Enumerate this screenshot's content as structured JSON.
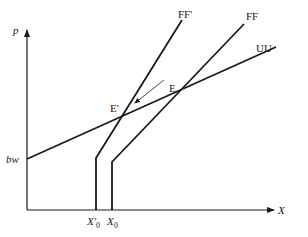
{
  "diagram": {
    "axes": {
      "y_label": "p",
      "x_label": "X"
    },
    "curves": [
      {
        "id": "UU",
        "label": "UU",
        "type": "upward-sloping line"
      },
      {
        "id": "FF",
        "label": "FF",
        "type": "kinked line (vertical then sloping)"
      },
      {
        "id": "FFprime",
        "label": "FF'",
        "type": "kinked line (vertical then sloping)"
      }
    ],
    "points": {
      "E": "E",
      "E_prime": "E'"
    },
    "intercepts": {
      "bw": "bw",
      "X0_prime": "X'",
      "X0": "X",
      "subscript": "0"
    },
    "arrow": {
      "from": "E",
      "to": "E'"
    },
    "colors": {
      "line": "#1a1a1a",
      "background": "#ffffff"
    }
  }
}
